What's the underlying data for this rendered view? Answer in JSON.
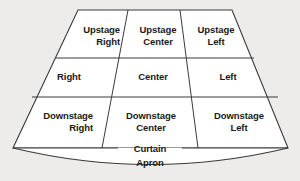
{
  "diagram": {
    "background_color": "#edecea",
    "stage_fill": "#ffffff",
    "line_color": "#3a3a3a",
    "text_color": "#1a1a1a",
    "zones": [
      {
        "id": "upstage-right",
        "label_line1": "Upstage",
        "label_line2": "Right",
        "row": 1,
        "column": 1
      },
      {
        "id": "upstage-center",
        "label_line1": "Upstage",
        "label_line2": "Center",
        "row": 1,
        "column": 2
      },
      {
        "id": "upstage-left",
        "label_line1": "Upstage",
        "label_line2": "Left",
        "row": 1,
        "column": 3
      },
      {
        "id": "right",
        "label_line1": "Right",
        "label_line2": "",
        "row": 2,
        "column": 1
      },
      {
        "id": "center",
        "label_line1": "Center",
        "label_line2": "",
        "row": 2,
        "column": 2
      },
      {
        "id": "left",
        "label_line1": "Left",
        "label_line2": "",
        "row": 2,
        "column": 3
      },
      {
        "id": "downstage-right",
        "label_line1": "Downstage",
        "label_line2": "Right",
        "row": 3,
        "column": 1
      },
      {
        "id": "downstage-center",
        "label_line1": "Downstage",
        "label_line2": "Center",
        "row": 3,
        "column": 2
      },
      {
        "id": "downstage-left",
        "label_line1": "Downstage",
        "label_line2": "Left",
        "row": 3,
        "column": 3
      }
    ],
    "curtain_label": "Curtain",
    "apron_label": "Apron"
  }
}
